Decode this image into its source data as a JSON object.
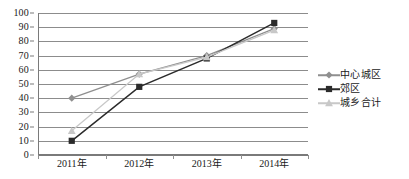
{
  "chart_data": {
    "type": "line",
    "title": "",
    "xlabel": "",
    "ylabel": "",
    "ylim": [
      0,
      100
    ],
    "ytick_step": 10,
    "grid": true,
    "legend_position": "right",
    "categories": [
      "2011年",
      "2012年",
      "2013年",
      "2014年"
    ],
    "yticks": [
      "100",
      "90",
      "80",
      "70",
      "60",
      "50",
      "40",
      "30",
      "20",
      "10",
      "0"
    ],
    "series": [
      {
        "name": "中心城区",
        "marker": "diamond",
        "color": "#8f8f8f",
        "values": [
          40,
          57,
          70,
          89
        ]
      },
      {
        "name": "郊区",
        "marker": "square",
        "color": "#2b2b2b",
        "values": [
          10,
          48,
          68,
          93
        ]
      },
      {
        "name": "城乡合计",
        "marker": "triangle",
        "color": "#c8c8c8",
        "values": [
          17,
          57,
          69,
          88
        ]
      }
    ]
  },
  "colors": {
    "gridline": "#8c8c8c",
    "axis": "#7a7a7a",
    "background": "#ffffff",
    "text": "#1a1a1a"
  }
}
